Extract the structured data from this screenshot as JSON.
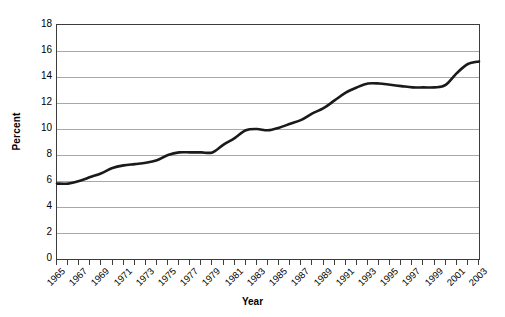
{
  "chart_data": {
    "type": "line",
    "title": "",
    "xlabel": "Year",
    "ylabel": "Percent",
    "xlim": [
      1965,
      2003
    ],
    "ylim": [
      0,
      18
    ],
    "y_ticks": [
      0,
      2,
      4,
      6,
      8,
      10,
      12,
      14,
      16,
      18
    ],
    "y_tick_labels": [
      "0",
      "2",
      "4",
      "6",
      "8",
      "10",
      "12",
      "14",
      "16",
      "18"
    ],
    "x_tick_labels": [
      "1965",
      "1967",
      "1969",
      "1971",
      "1973",
      "1975",
      "1977",
      "1979",
      "1981",
      "1983",
      "1985",
      "1987",
      "1989",
      "1991",
      "1993",
      "1995",
      "1997",
      "1999",
      "2001",
      "2003"
    ],
    "x_tick_label_step": 2,
    "x_minor_tick_step": 1,
    "grid": "horizontal",
    "legend": "none",
    "line_color": "#1a1a1a",
    "line_width": 2.6,
    "grid_color": "#a8a8a8",
    "axis_color": "#3c3c3c",
    "x": [
      1965,
      1966,
      1967,
      1968,
      1969,
      1970,
      1971,
      1972,
      1973,
      1974,
      1975,
      1976,
      1977,
      1978,
      1979,
      1980,
      1981,
      1982,
      1983,
      1984,
      1985,
      1986,
      1987,
      1988,
      1989,
      1990,
      1991,
      1992,
      1993,
      1994,
      1995,
      1996,
      1997,
      1998,
      1999,
      2000,
      2001,
      2002,
      2003
    ],
    "values": [
      5.8,
      5.8,
      6.0,
      6.3,
      6.6,
      7.0,
      7.2,
      7.3,
      7.4,
      7.6,
      8.0,
      8.2,
      8.2,
      8.2,
      8.2,
      8.8,
      9.3,
      9.9,
      10.0,
      9.9,
      10.1,
      10.4,
      10.7,
      11.2,
      11.6,
      12.2,
      12.8,
      13.2,
      13.5,
      13.5,
      13.4,
      13.3,
      13.2,
      13.2,
      13.2,
      13.4,
      14.3,
      15.0,
      15.2
    ]
  }
}
